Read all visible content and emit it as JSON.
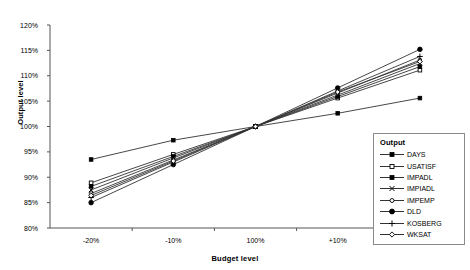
{
  "chart_data": {
    "type": "line",
    "title": "",
    "xlabel": "Budget level",
    "ylabel": "Output level",
    "categories": [
      "-20%",
      "-10%",
      "100%",
      "+10%",
      "+20%"
    ],
    "ytick_labels": [
      "80%",
      "85%",
      "90%",
      "95%",
      "100%",
      "105%",
      "110%",
      "115%",
      "120%"
    ],
    "ylim": [
      80,
      120
    ],
    "ytick_step": 5,
    "grid": false,
    "legend_position": "inside-bottom-right",
    "legend_title": "Output",
    "series": [
      {
        "name": "DAYS",
        "marker": "filled-square",
        "values": [
          93.5,
          97.3,
          100,
          102.6,
          105.6
        ]
      },
      {
        "name": "USATISF",
        "marker": "open-square",
        "values": [
          88.9,
          94.5,
          100,
          105.6,
          111.1
        ]
      },
      {
        "name": "IMPADL",
        "marker": "filled-square",
        "values": [
          88.2,
          94.1,
          100,
          105.9,
          111.8
        ]
      },
      {
        "name": "IMPIADL",
        "marker": "cross-x",
        "values": [
          87.5,
          93.8,
          100,
          106.2,
          112.4
        ]
      },
      {
        "name": "IMPEMP",
        "marker": "open-circle",
        "values": [
          86.8,
          93.4,
          100,
          106.6,
          113.1
        ]
      },
      {
        "name": "DLD",
        "marker": "filled-circle",
        "values": [
          85.0,
          92.5,
          100,
          107.6,
          115.2
        ]
      },
      {
        "name": "KOSBERG",
        "marker": "plus",
        "values": [
          86.0,
          93.0,
          100,
          107.0,
          113.8
        ]
      },
      {
        "name": "WKSAT",
        "marker": "open-diamond",
        "values": [
          86.4,
          93.2,
          100,
          106.8,
          112.8
        ]
      }
    ]
  },
  "legend": {
    "title": "Output",
    "items": [
      {
        "label": "DAYS"
      },
      {
        "label": "USATISF"
      },
      {
        "label": "IMPADL"
      },
      {
        "label": "IMPIADL"
      },
      {
        "label": "IMPEMP"
      },
      {
        "label": "DLD"
      },
      {
        "label": "KOSBERG"
      },
      {
        "label": "WKSAT"
      }
    ]
  },
  "axes": {
    "y_title": "Output level",
    "x_title": "Budget level"
  }
}
